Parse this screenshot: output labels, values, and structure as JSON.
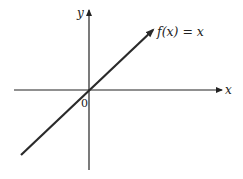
{
  "diagram": {
    "function_label": "f(x) = x",
    "x_axis_label": "x",
    "y_axis_label": "y",
    "origin_label": "0",
    "colors": {
      "line": "#2a2a2a",
      "axes": "#222222",
      "background": "#ffffff"
    }
  }
}
